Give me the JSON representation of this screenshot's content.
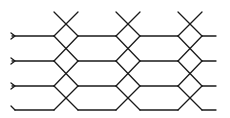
{
  "diagram": {
    "type": "wire-crossing-network",
    "stroke_color": "#1a1a1a",
    "background": "#ffffff",
    "wires": 4,
    "wire_y": [
      36,
      61,
      86,
      110
    ],
    "crossing_groups_center_x": [
      66,
      128,
      190
    ],
    "left_x": 12,
    "right_x": 215
  }
}
